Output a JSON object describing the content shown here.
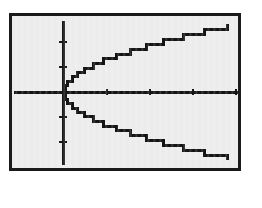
{
  "figure": {
    "frame": {
      "border_color": "#1b1b1b",
      "screen_background": "#ececec",
      "page_background": "#ffffff",
      "ink_color": "#141414",
      "left": 9,
      "top": 13,
      "width": 232,
      "height": 158,
      "border_width": 3
    }
  },
  "chart_data": {
    "type": "line",
    "title": "",
    "subtitle": "",
    "xlabel": "",
    "ylabel": "",
    "grid": false,
    "legend_position": "none",
    "axes": {
      "x_axis_visible": true,
      "y_axis_visible": true,
      "origin_px": {
        "x": 51,
        "y": 76
      },
      "x_axis_px": {
        "y": 76,
        "x_start": 2,
        "x_end": 227
      },
      "y_axis_px": {
        "x": 51,
        "y_start": 5,
        "y_end": 149
      },
      "x_tick_px": [
        95,
        138,
        181,
        224
      ],
      "y_tick_px": [
        26,
        51,
        101,
        126
      ],
      "tick_length_px": 5,
      "xlim": [
        -1,
        10
      ],
      "ylim": [
        -3.2,
        3.2
      ]
    },
    "relation": "x = y^2",
    "series": [
      {
        "name": "upper-branch",
        "expression": "y = sqrt(x)",
        "x": [
          0,
          0.1,
          0.25,
          0.5,
          0.8,
          1.2,
          1.7,
          2.3,
          3.0,
          3.8,
          4.7,
          5.7,
          6.8,
          8.0,
          9.3
        ],
        "y": [
          0,
          0.32,
          0.5,
          0.71,
          0.89,
          1.1,
          1.3,
          1.52,
          1.73,
          1.95,
          2.17,
          2.39,
          2.61,
          2.83,
          3.05
        ]
      },
      {
        "name": "lower-branch",
        "expression": "y = -sqrt(x)",
        "x": [
          0,
          0.1,
          0.25,
          0.5,
          0.8,
          1.2,
          1.7,
          2.3,
          3.0,
          3.8,
          4.7,
          5.7,
          6.8,
          8.0,
          9.3
        ],
        "y": [
          0,
          -0.32,
          -0.5,
          -0.71,
          -0.89,
          -1.1,
          -1.3,
          -1.52,
          -1.73,
          -1.95,
          -2.17,
          -2.39,
          -2.61,
          -2.83,
          -3.05
        ]
      }
    ]
  }
}
